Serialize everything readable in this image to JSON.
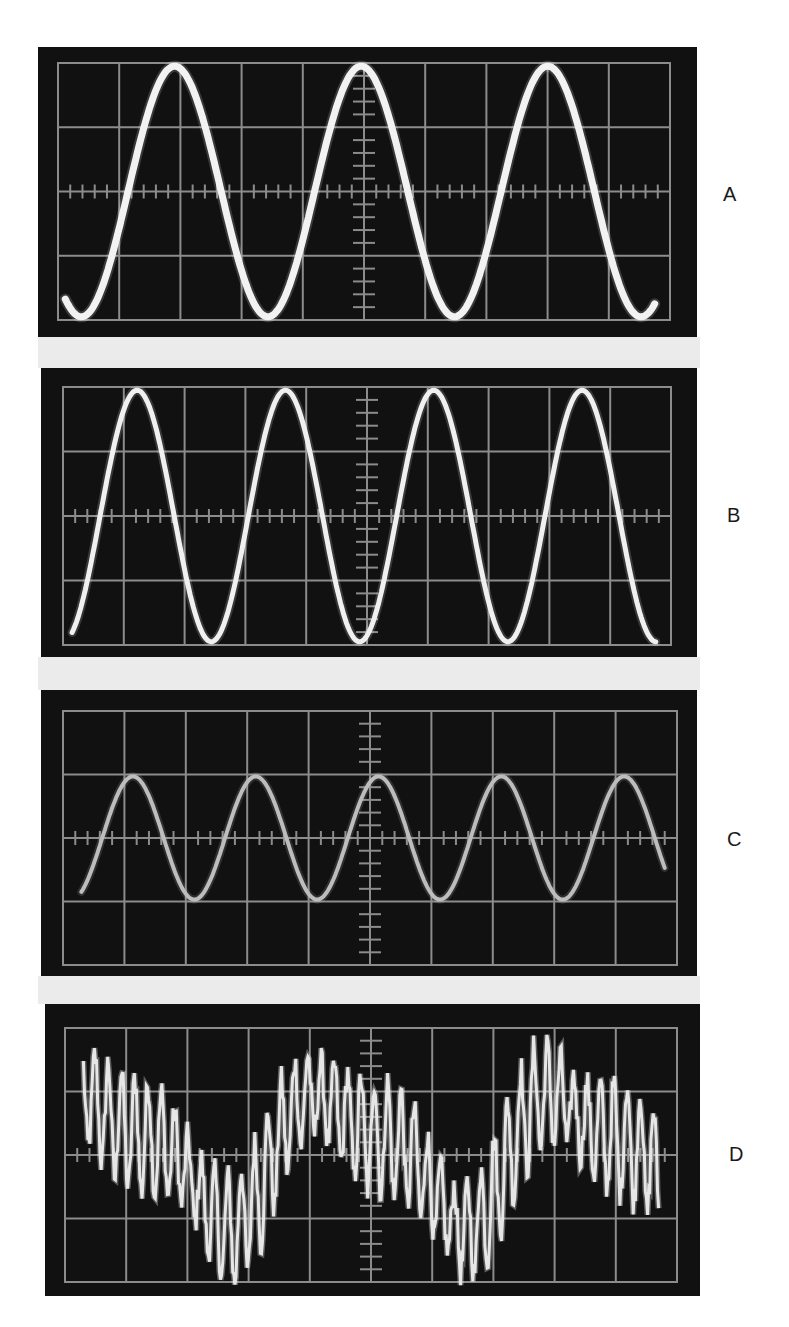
{
  "figure": {
    "panels": [
      {
        "label": "A",
        "trace": "sine",
        "box": {
          "left": 38,
          "top": 47,
          "width": 659,
          "height": 290
        },
        "grid": {
          "x": 20,
          "y": 16,
          "w": 612,
          "h": 257
        },
        "wave": {
          "cycles_per_div": 0.328,
          "amplitude_div": 1.95,
          "phase_deg": -45,
          "x_start_div": 0.12,
          "x_end_div": 9.75,
          "stroke": "#f2f2f2",
          "width": 7
        }
      },
      {
        "label": "B",
        "trace": "sine",
        "box": {
          "left": 41,
          "top": 368,
          "width": 656,
          "height": 289
        },
        "grid": {
          "x": 22,
          "y": 19,
          "w": 608,
          "h": 258
        },
        "wave": {
          "cycles_per_div": 0.41,
          "amplitude_div": 1.95,
          "phase_deg": 0,
          "x_start_div": 0.15,
          "x_end_div": 9.75,
          "stroke": "#f0f0f0",
          "width": 5
        }
      },
      {
        "label": "C",
        "trace": "sine",
        "box": {
          "left": 41,
          "top": 690,
          "width": 656,
          "height": 286
        },
        "grid": {
          "x": 22,
          "y": 21,
          "w": 614,
          "h": 254
        },
        "wave": {
          "cycles_per_div": 0.5,
          "amplitude_div": 0.97,
          "phase_deg": -25,
          "x_start_div": 0.3,
          "x_end_div": 9.8,
          "stroke": "#bdbdbd",
          "width": 4
        }
      },
      {
        "label": "D",
        "trace": "noisy",
        "box": {
          "left": 45,
          "top": 1004,
          "width": 655,
          "height": 292
        },
        "grid": {
          "x": 20,
          "y": 24,
          "w": 612,
          "h": 254
        },
        "wave": {
          "stroke": "#e6e6e6",
          "width": 3
        }
      }
    ],
    "grid": {
      "divisions_x": 10,
      "divisions_y": 4,
      "line_color": "#8c8c8c",
      "minor_ticks_per_div": 5
    }
  },
  "labels": {
    "a": "A",
    "b": "B",
    "c": "C",
    "d": "D"
  },
  "colors": {
    "screen": "#111111",
    "graticule": "#8c8c8c",
    "separator": "#ebebeb",
    "background": "#ffffff"
  }
}
